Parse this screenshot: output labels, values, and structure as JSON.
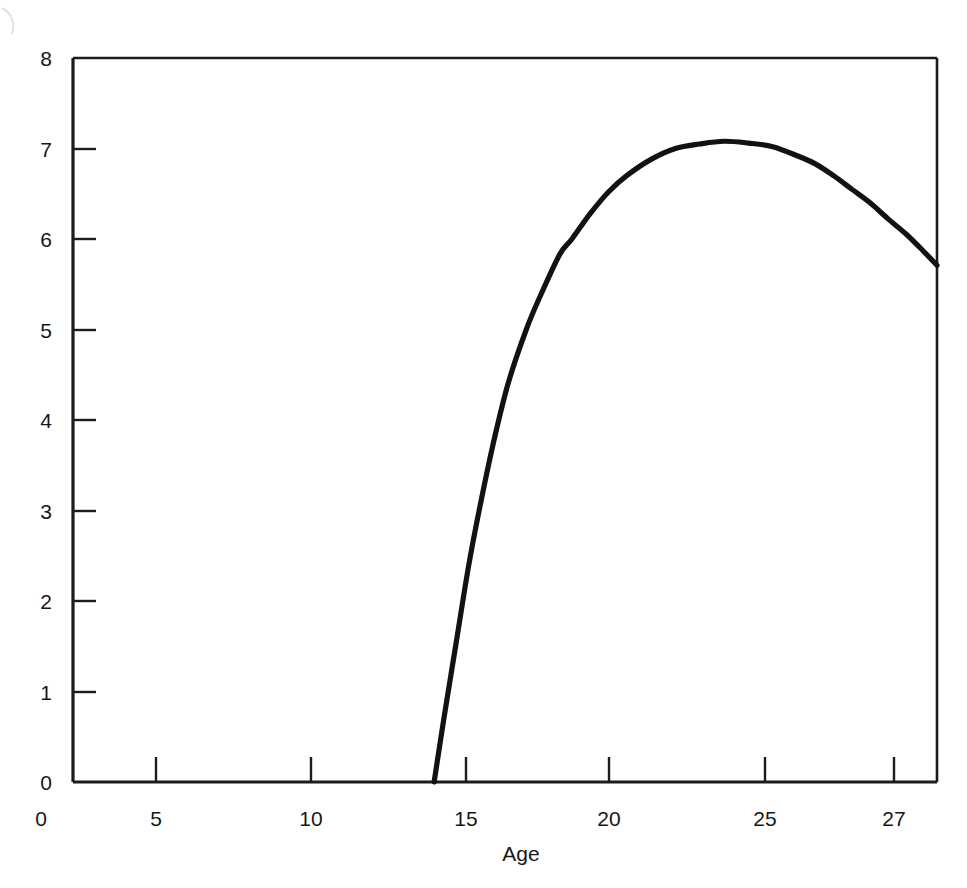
{
  "chart_data": {
    "type": "line",
    "title": "",
    "subtitle": "",
    "xlabel": "Age",
    "ylabel": "",
    "xlim": [
      0,
      28.4
    ],
    "ylim": [
      0,
      8
    ],
    "grid": false,
    "legend": null,
    "x_ticks": [
      0,
      5,
      10,
      15,
      20,
      25,
      27
    ],
    "x_tick_labels": [
      "0",
      "5",
      "10",
      "15",
      "20",
      "25",
      "27"
    ],
    "y_ticks": [
      0,
      1,
      2,
      3,
      4,
      5,
      6,
      7,
      8
    ],
    "y_tick_labels": [
      "0",
      "1",
      "2",
      "3",
      "4",
      "5",
      "6",
      "7",
      "8"
    ],
    "series": [
      {
        "name": "curve",
        "color": "#121212",
        "x": [
          11.87,
          12.2,
          12.6,
          13.0,
          13.35,
          13.8,
          14.3,
          14.9,
          15.4,
          16.0,
          16.4,
          17.0,
          17.6,
          18.2,
          19.0,
          19.8,
          20.6,
          21.4,
          22.2,
          23.0,
          23.8,
          24.4,
          25.0,
          25.6,
          26.2,
          26.8,
          27.4,
          28.0,
          28.4
        ],
        "y": [
          0.0,
          0.72,
          1.55,
          2.38,
          3.0,
          3.72,
          4.4,
          5.0,
          5.4,
          5.83,
          6.0,
          6.28,
          6.52,
          6.7,
          6.88,
          7.0,
          7.05,
          7.08,
          7.06,
          7.02,
          6.92,
          6.83,
          6.7,
          6.55,
          6.4,
          6.22,
          6.05,
          5.85,
          5.71
        ]
      }
    ],
    "annotations": []
  },
  "axes": {
    "x_axis_title": "Age",
    "origin_label": "0"
  }
}
